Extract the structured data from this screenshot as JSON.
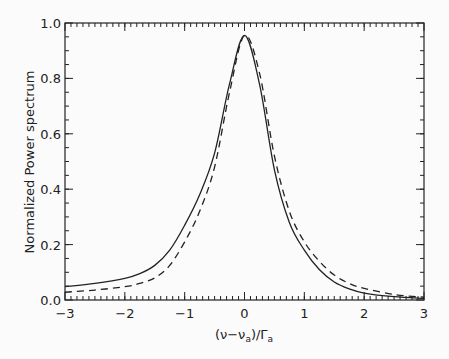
{
  "chart_data": {
    "type": "line",
    "title": "",
    "xlabel": "(ν−ν_a)/Γ_a",
    "xlabel_parts": {
      "open": "(ν−ν",
      "sub1": "a",
      "mid": ")/Γ",
      "sub2": "a"
    },
    "ylabel": "Normalized Power spectrum",
    "xlim": [
      -3,
      3
    ],
    "ylim": [
      0.0,
      1.0
    ],
    "grid": false,
    "legend": null,
    "x_ticks": [
      -3,
      -2,
      -1,
      0,
      1,
      2,
      3
    ],
    "x_tick_labels": [
      "−3",
      "−2",
      "−1",
      "0",
      "1",
      "2",
      "3"
    ],
    "x_minor_step": 0.1,
    "y_ticks": [
      0.0,
      0.2,
      0.4,
      0.6,
      0.8,
      1.0
    ],
    "y_tick_labels": [
      "0.0",
      "0.2",
      "0.4",
      "0.6",
      "0.8",
      "1.0"
    ],
    "y_minor_step": 0.05,
    "x": [
      -3,
      -2.5,
      -2,
      -1.75,
      -1.5,
      -1.25,
      -1,
      -0.75,
      -0.5,
      -0.25,
      0,
      0.25,
      0.5,
      0.75,
      1,
      1.25,
      1.5,
      1.75,
      2,
      2.5,
      3
    ],
    "series": [
      {
        "name": "solid",
        "style": "solid",
        "color": "#222222",
        "values": [
          0.048,
          0.06,
          0.078,
          0.095,
          0.125,
          0.18,
          0.27,
          0.38,
          0.53,
          0.78,
          0.955,
          0.78,
          0.47,
          0.28,
          0.18,
          0.11,
          0.065,
          0.04,
          0.025,
          0.012,
          0.006
        ]
      },
      {
        "name": "dashed",
        "style": "dashed",
        "color": "#222222",
        "values": [
          0.028,
          0.036,
          0.048,
          0.06,
          0.08,
          0.125,
          0.21,
          0.32,
          0.48,
          0.75,
          0.955,
          0.82,
          0.52,
          0.32,
          0.21,
          0.14,
          0.09,
          0.06,
          0.042,
          0.02,
          0.01
        ]
      }
    ]
  }
}
